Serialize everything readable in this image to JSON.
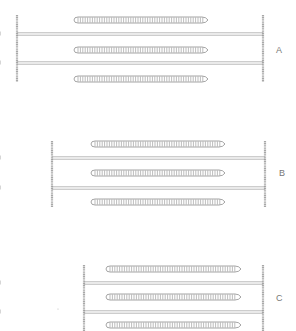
{
  "colors": {
    "background": "#ffffff",
    "z_line": "#a8a8a8",
    "thin_filament": "#9a9a9a",
    "thick_filament": "#8e8e8e",
    "label": "#777777"
  },
  "panels": [
    {
      "label": "A",
      "label_pos": [
        276,
        45
      ],
      "z_left": 17,
      "z_right": 263,
      "z_top": 15,
      "z_bottom": 82,
      "thick": {
        "x1": 74,
        "x2": 208,
        "ys": [
          20,
          50,
          79
        ]
      },
      "thin": {
        "left_end": 110,
        "right_start": 173,
        "ys": [
          34,
          63
        ]
      }
    },
    {
      "label": "B",
      "label_pos": [
        279,
        168
      ],
      "z_left": 52,
      "z_right": 265,
      "z_top": 141,
      "z_bottom": 207,
      "thick": {
        "x1": 91,
        "x2": 225,
        "ys": [
          144,
          173,
          202
        ]
      },
      "thin": {
        "left_end": 148,
        "right_start": 168,
        "ys": [
          158,
          188
        ]
      }
    },
    {
      "label": "C",
      "label_pos": [
        276,
        293
      ],
      "z_left": 84,
      "z_right": 263,
      "z_top": 265,
      "z_bottom": 331,
      "thick": {
        "x1": 106,
        "x2": 241,
        "ys": [
          269,
          297,
          325
        ]
      },
      "thin": {
        "left_end": 173,
        "right_start": 173,
        "ys": [
          283,
          312
        ]
      }
    }
  ]
}
